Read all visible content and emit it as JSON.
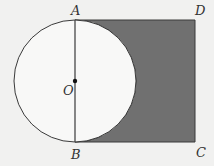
{
  "diagram": {
    "labels": {
      "A": "A",
      "B": "B",
      "C": "C",
      "D": "D",
      "O": "O"
    },
    "colors": {
      "shade": "#707070",
      "stroke": "#3a3a3a",
      "background": "#f1f1f0"
    }
  }
}
